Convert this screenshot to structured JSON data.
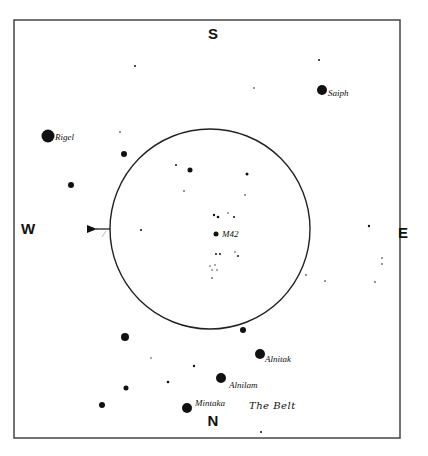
{
  "chart": {
    "frame": {
      "x": 14,
      "y": 20,
      "width": 386,
      "height": 418,
      "stroke": "#444444"
    },
    "field_circle": {
      "cx": 210,
      "cy": 229,
      "r": 100,
      "stroke": "#222222"
    },
    "directions": {
      "south": {
        "label": "S",
        "x": 213,
        "y": 39
      },
      "west": {
        "label": "W",
        "x": 28,
        "y": 234
      },
      "east": {
        "label": "E",
        "x": 403,
        "y": 238
      },
      "north": {
        "label": "N",
        "x": 213,
        "y": 426
      }
    },
    "drift_arrow": {
      "from_x": 110,
      "to_x": 88,
      "y": 229,
      "label": ""
    },
    "named_stars": [
      {
        "name": "Rigel",
        "x": 48,
        "y": 136,
        "r": 6.5,
        "label_dx": 7,
        "label_dy": 4
      },
      {
        "name": "Saiph",
        "x": 322,
        "y": 90,
        "r": 5,
        "label_dx": 6,
        "label_dy": 6
      },
      {
        "name": "Alnitak",
        "x": 260,
        "y": 354,
        "r": 5,
        "label_dx": 5,
        "label_dy": 8
      },
      {
        "name": "Alnilam",
        "x": 221,
        "y": 378,
        "r": 5,
        "label_dx": 8,
        "label_dy": 10
      },
      {
        "name": "Mintaka",
        "x": 187,
        "y": 408,
        "r": 5,
        "label_dx": 8,
        "label_dy": -2
      }
    ],
    "object": {
      "name": "M42",
      "x": 216,
      "y": 234,
      "r": 2.5,
      "label": "M42",
      "label_x": 222,
      "label_y": 237
    },
    "belt_label": {
      "text": "The Belt",
      "x": 249,
      "y": 409
    },
    "stars": [
      {
        "x": 135,
        "y": 66,
        "r": 1
      },
      {
        "x": 319,
        "y": 60,
        "r": 1
      },
      {
        "x": 254,
        "y": 88,
        "r": 0.8
      },
      {
        "x": 120,
        "y": 132,
        "r": 0.8
      },
      {
        "x": 124,
        "y": 154,
        "r": 3
      },
      {
        "x": 71,
        "y": 185,
        "r": 3
      },
      {
        "x": 176,
        "y": 165,
        "r": 1
      },
      {
        "x": 190,
        "y": 170,
        "r": 2.5
      },
      {
        "x": 184,
        "y": 191,
        "r": 0.8
      },
      {
        "x": 247,
        "y": 174,
        "r": 1.5
      },
      {
        "x": 245,
        "y": 195,
        "r": 0.8
      },
      {
        "x": 214,
        "y": 215,
        "r": 1.2
      },
      {
        "x": 218,
        "y": 217,
        "r": 1.3
      },
      {
        "x": 228,
        "y": 213,
        "r": 0.7
      },
      {
        "x": 234,
        "y": 217,
        "r": 1
      },
      {
        "x": 216,
        "y": 254,
        "r": 1
      },
      {
        "x": 220,
        "y": 254,
        "r": 1
      },
      {
        "x": 235,
        "y": 252,
        "r": 0.7
      },
      {
        "x": 238,
        "y": 256,
        "r": 1
      },
      {
        "x": 210,
        "y": 266,
        "r": 0.7
      },
      {
        "x": 215,
        "y": 265,
        "r": 0.7
      },
      {
        "x": 212,
        "y": 270,
        "r": 0.7
      },
      {
        "x": 217,
        "y": 270,
        "r": 0.7
      },
      {
        "x": 212,
        "y": 278,
        "r": 0.8
      },
      {
        "x": 141,
        "y": 230,
        "r": 1
      },
      {
        "x": 306,
        "y": 275,
        "r": 0.8
      },
      {
        "x": 369,
        "y": 226,
        "r": 1.2
      },
      {
        "x": 382,
        "y": 258,
        "r": 0.8
      },
      {
        "x": 382,
        "y": 264,
        "r": 0.8
      },
      {
        "x": 325,
        "y": 281,
        "r": 0.8
      },
      {
        "x": 375,
        "y": 282,
        "r": 0.8
      },
      {
        "x": 243,
        "y": 330,
        "r": 3
      },
      {
        "x": 125,
        "y": 337,
        "r": 4
      },
      {
        "x": 151,
        "y": 358,
        "r": 0.7
      },
      {
        "x": 194,
        "y": 366,
        "r": 1.2
      },
      {
        "x": 168,
        "y": 382,
        "r": 1.3
      },
      {
        "x": 126,
        "y": 388,
        "r": 2.5
      },
      {
        "x": 102,
        "y": 405,
        "r": 3
      },
      {
        "x": 261,
        "y": 432,
        "r": 1
      }
    ]
  }
}
